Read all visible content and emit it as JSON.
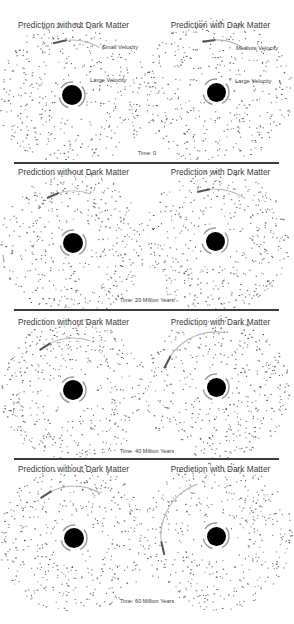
{
  "figure": {
    "column_titles": [
      "Prediction without Dark Matter",
      "Prediction with Dark Matter"
    ],
    "annotations": {
      "left": {
        "outer": "Small Velocity",
        "inner": "Large Velocity"
      },
      "right": {
        "outer": "Medium Velocity",
        "inner": "Large Velocity"
      }
    },
    "rows": [
      {
        "time_label": "Time:  0",
        "left_title": "Prediction without Dark Matter",
        "right_title": "Prediction with Dark Matter"
      },
      {
        "time_label": "Time:  20 Million Years",
        "left_title": "Prediction without Dark Matter",
        "right_title": "Prediction with Dark Matter"
      },
      {
        "time_label": "Time:  40 Million Years",
        "left_title": "Prediction without Dark Matter",
        "right_title": "Prediction with Dark Matter"
      },
      {
        "time_label": "Time:  60 Million Years",
        "left_title": "Prediction without Dark Matter",
        "right_title": "Prediction with Dark Matter"
      }
    ],
    "colors": {
      "mass": "#000000",
      "particles": "#4a4a4a",
      "separator": "#3b3b3b",
      "background": "#ffffff"
    }
  }
}
